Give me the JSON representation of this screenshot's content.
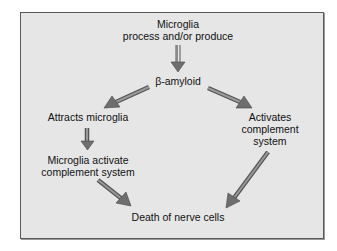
{
  "diagram": {
    "background": "#e6e6e6",
    "border_color": "#5a5a5a",
    "arrow_color": "#6e6e6e",
    "nodes": {
      "top": {
        "line1": "Microglia",
        "line2": "process and/or produce"
      },
      "amyloid": {
        "text": "β-amyloid"
      },
      "attracts": {
        "text": "Attracts microglia"
      },
      "activates": {
        "line1": "Activates",
        "line2": "complement",
        "line3": "system"
      },
      "microglia_activate": {
        "line1": "Microglia activate",
        "line2": "complement system"
      },
      "death": {
        "text": "Death of nerve cells"
      }
    },
    "edges": [
      {
        "from": "top",
        "to": "amyloid"
      },
      {
        "from": "amyloid",
        "to": "attracts"
      },
      {
        "from": "amyloid",
        "to": "activates"
      },
      {
        "from": "attracts",
        "to": "microglia_activate"
      },
      {
        "from": "microglia_activate",
        "to": "death"
      },
      {
        "from": "activates",
        "to": "death"
      }
    ]
  }
}
